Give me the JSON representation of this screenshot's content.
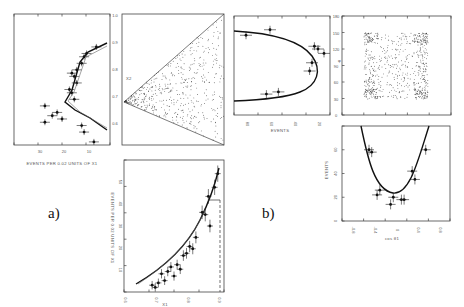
{
  "figure": {
    "panel_labels": [
      "a)",
      "b)"
    ]
  },
  "chart_data": [
    {
      "id": "a-left",
      "type": "scatter",
      "title": "",
      "xlabel": "EVENTS PER 0.02 UNITS OF X1",
      "ylabel": "",
      "x_tick_labels": [
        "30",
        "20",
        "10"
      ],
      "orientation": "rotated (events on horizontal axis, x2 vertical)",
      "points": [
        {
          "events": 7,
          "x2": 0.93
        },
        {
          "events": 11,
          "x2": 0.91
        },
        {
          "events": 12,
          "x2": 0.9
        },
        {
          "events": 13,
          "x2": 0.88
        },
        {
          "events": 15,
          "x2": 0.86
        },
        {
          "events": 17,
          "x2": 0.85
        },
        {
          "events": 16,
          "x2": 0.84
        },
        {
          "events": 15,
          "x2": 0.82
        },
        {
          "events": 18,
          "x2": 0.8
        },
        {
          "events": 17,
          "x2": 0.79
        },
        {
          "events": 16,
          "x2": 0.77
        },
        {
          "events": 28,
          "x2": 0.75
        },
        {
          "events": 23,
          "x2": 0.73
        },
        {
          "events": 25,
          "x2": 0.72
        },
        {
          "events": 28,
          "x2": 0.7
        },
        {
          "events": 21,
          "x2": 0.71
        },
        {
          "events": 13,
          "x2": 0.69
        },
        {
          "events": 12,
          "x2": 0.67
        },
        {
          "events": 8,
          "x2": 0.64
        }
      ]
    },
    {
      "id": "a-dalitz",
      "type": "scatter",
      "title": "",
      "xlabel": "",
      "ylabel": "X2",
      "y_tick_labels": [
        "1.0",
        "0.9",
        "0.8",
        "0.7",
        "0.6"
      ],
      "description": "Dalitz triangle, density of events"
    },
    {
      "id": "a-bottom",
      "type": "scatter",
      "title": "",
      "xlabel": "X1",
      "ylabel": "EVENTS PER 0.02 UNITS OF X1",
      "x_tick_labels": [
        "0.6",
        "0.7",
        "0.8",
        "0.9"
      ],
      "y_tick_labels": [
        "10",
        "20",
        "30",
        "40",
        "50"
      ],
      "xlim": [
        0.6,
        0.92
      ],
      "ylim": [
        0,
        58
      ],
      "points": [
        {
          "x": 0.69,
          "y": 3
        },
        {
          "x": 0.7,
          "y": 2
        },
        {
          "x": 0.71,
          "y": 4
        },
        {
          "x": 0.72,
          "y": 8
        },
        {
          "x": 0.73,
          "y": 5
        },
        {
          "x": 0.74,
          "y": 9
        },
        {
          "x": 0.75,
          "y": 11
        },
        {
          "x": 0.76,
          "y": 7
        },
        {
          "x": 0.77,
          "y": 12
        },
        {
          "x": 0.78,
          "y": 10
        },
        {
          "x": 0.79,
          "y": 16
        },
        {
          "x": 0.8,
          "y": 17
        },
        {
          "x": 0.81,
          "y": 20
        },
        {
          "x": 0.82,
          "y": 19
        },
        {
          "x": 0.83,
          "y": 24
        },
        {
          "x": 0.85,
          "y": 35
        },
        {
          "x": 0.86,
          "y": 34
        },
        {
          "x": 0.87,
          "y": 42
        },
        {
          "x": 0.875,
          "y": 29
        },
        {
          "x": 0.89,
          "y": 46
        },
        {
          "x": 0.9,
          "y": 52
        }
      ]
    },
    {
      "id": "b-events",
      "type": "scatter",
      "title": "",
      "xlabel": "EVENTS",
      "ylabel": "",
      "x_tick_labels": [
        "80",
        "60",
        "40",
        "20"
      ],
      "points": [
        {
          "events": 75,
          "phi": 145
        },
        {
          "events": 55,
          "phi": 155
        },
        {
          "events": 18,
          "phi": 125
        },
        {
          "events": 15,
          "phi": 120
        },
        {
          "events": 10,
          "phi": 112
        },
        {
          "events": 20,
          "phi": 95
        },
        {
          "events": 22,
          "phi": 80
        },
        {
          "events": 58,
          "phi": 38
        },
        {
          "events": 48,
          "phi": 42
        }
      ]
    },
    {
      "id": "b-scatter",
      "type": "scatter",
      "title": "",
      "xlabel": "",
      "ylabel": "φ",
      "y_tick_labels": [
        "180",
        "150",
        "120",
        "90",
        "60",
        "30",
        "0"
      ],
      "description": "Uniform-ish scatter in φ vs cos θ"
    },
    {
      "id": "b-bottom",
      "type": "scatter",
      "title": "",
      "xlabel": "cos θ1",
      "ylabel": "EVENTS",
      "x_tick_labels": [
        "-0.8",
        "-0.4",
        "0",
        "0.4",
        "0.8"
      ],
      "y_tick_labels": [
        "0",
        "20",
        "40",
        "60"
      ],
      "xlim": [
        -1.0,
        1.0
      ],
      "ylim": [
        0,
        80
      ],
      "points": [
        {
          "x": -0.5,
          "y": 60
        },
        {
          "x": -0.45,
          "y": 58
        },
        {
          "x": -0.3,
          "y": 26
        },
        {
          "x": -0.35,
          "y": 22
        },
        {
          "x": -0.1,
          "y": 14
        },
        {
          "x": -0.05,
          "y": 20
        },
        {
          "x": 0.1,
          "y": 18
        },
        {
          "x": 0.15,
          "y": 18
        },
        {
          "x": 0.3,
          "y": 42
        },
        {
          "x": 0.35,
          "y": 35
        },
        {
          "x": 0.55,
          "y": 60
        }
      ]
    }
  ]
}
